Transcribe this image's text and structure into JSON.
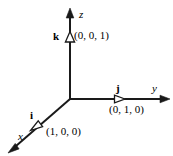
{
  "figure": {
    "stroke_color": "#1a1a1a",
    "text_color": "#000000",
    "background_color": "#ffffff"
  },
  "axes": [
    {
      "id": "x",
      "label": "x",
      "direction": "down-left"
    },
    {
      "id": "y",
      "label": "y",
      "direction": "right"
    },
    {
      "id": "z",
      "label": "z",
      "direction": "up"
    }
  ],
  "vectors": [
    {
      "id": "i",
      "name": "i",
      "coordinate_label": "(1, 0, 0)",
      "along_axis": "x"
    },
    {
      "id": "j",
      "name": "j",
      "coordinate_label": "(0, 1, 0)",
      "along_axis": "y"
    },
    {
      "id": "k",
      "name": "k",
      "coordinate_label": "(0, 0, 1)",
      "along_axis": "z"
    }
  ]
}
